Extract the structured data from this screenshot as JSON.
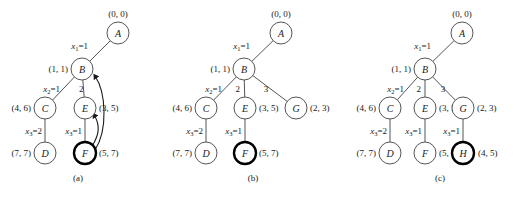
{
  "figure": {
    "width": 522,
    "height": 197,
    "background": "#ffffff",
    "node_stroke": "#555555",
    "bold_node_stroke": "#000000",
    "text_color": "#1a1a1a"
  },
  "panels": [
    {
      "id": "a",
      "caption": "(a)",
      "caption_pos": {
        "x": 78,
        "y": 178
      },
      "nodes": [
        {
          "key": "A",
          "label": "A",
          "x": 118,
          "y": 33,
          "r": 11,
          "bold": false,
          "pair": "(0, 0)",
          "pair_pos": "above",
          "pair_x": 118,
          "pair_y": 14
        },
        {
          "key": "B",
          "label": "B",
          "x": 82,
          "y": 69,
          "r": 11,
          "bold": false,
          "pair": "(1, 1)",
          "pair_pos": "left",
          "pair_x": 68,
          "pair_y": 69
        },
        {
          "key": "C",
          "label": "C",
          "x": 45,
          "y": 108,
          "r": 11,
          "bold": false,
          "pair": "(4, 6)",
          "pair_pos": "left",
          "pair_x": 31,
          "pair_y": 108
        },
        {
          "key": "E",
          "label": "E",
          "x": 85,
          "y": 108,
          "r": 11,
          "bold": false,
          "pair": "(3, 5)",
          "pair_pos": "right",
          "pair_x": 99,
          "pair_y": 108
        },
        {
          "key": "D",
          "label": "D",
          "x": 45,
          "y": 153,
          "r": 11,
          "bold": false,
          "pair": "(7, 7)",
          "pair_pos": "left",
          "pair_x": 31,
          "pair_y": 153
        },
        {
          "key": "F",
          "label": "F",
          "x": 85,
          "y": 153,
          "r": 11,
          "bold": true,
          "pair": "(5, 7)",
          "pair_pos": "right",
          "pair_x": 99,
          "pair_y": 153
        }
      ],
      "edges": [
        {
          "from": "A",
          "to": "B",
          "label": "x1=1",
          "var": "x",
          "sub": "1",
          "value": "=1",
          "label_x": 88,
          "label_y": 46,
          "label_anchor": "left"
        },
        {
          "from": "B",
          "to": "C",
          "label": "x2=1",
          "var": "x",
          "sub": "2",
          "value": "=1",
          "label_x": 60,
          "label_y": 89,
          "label_anchor": "left"
        },
        {
          "from": "B",
          "to": "E",
          "label": "2",
          "var": "",
          "sub": "",
          "value": "2",
          "label_x": 79,
          "label_y": 89,
          "label_anchor": "rt"
        },
        {
          "from": "C",
          "to": "D",
          "label": "x3=2",
          "var": "x",
          "sub": "3",
          "value": "=2",
          "label_x": 42,
          "label_y": 131,
          "label_anchor": "left"
        },
        {
          "from": "E",
          "to": "F",
          "label": "x3=1",
          "var": "x",
          "sub": "3",
          "value": "=1",
          "label_x": 82,
          "label_y": 131,
          "label_anchor": "left"
        }
      ],
      "arrows": [
        {
          "name": "arrow-f-to-e",
          "d": "M 92 146 C 100 134 100 124 94 115"
        },
        {
          "name": "arrow-f-to-b",
          "d": "M 95 150 C 108 130 106 92 95 76"
        }
      ]
    },
    {
      "id": "b",
      "caption": "(b)",
      "caption_pos": {
        "x": 253,
        "y": 178
      },
      "nodes": [
        {
          "key": "A",
          "label": "A",
          "x": 281,
          "y": 33,
          "r": 11,
          "bold": false,
          "pair": "(0, 0)",
          "pair_pos": "above",
          "pair_x": 281,
          "pair_y": 14
        },
        {
          "key": "B",
          "label": "B",
          "x": 244,
          "y": 69,
          "r": 11,
          "bold": false,
          "pair": "(1, 1)",
          "pair_pos": "left",
          "pair_x": 230,
          "pair_y": 69
        },
        {
          "key": "C",
          "label": "C",
          "x": 206,
          "y": 108,
          "r": 11,
          "bold": false,
          "pair": "(4, 6)",
          "pair_pos": "left",
          "pair_x": 192,
          "pair_y": 108
        },
        {
          "key": "E",
          "label": "E",
          "x": 245,
          "y": 108,
          "r": 11,
          "bold": false,
          "pair": "(3, 5)",
          "pair_pos": "right",
          "pair_x": 259,
          "pair_y": 108
        },
        {
          "key": "G",
          "label": "G",
          "x": 296,
          "y": 108,
          "r": 11,
          "bold": false,
          "pair": "(2, 3)",
          "pair_pos": "right",
          "pair_x": 310,
          "pair_y": 108
        },
        {
          "key": "D",
          "label": "D",
          "x": 206,
          "y": 153,
          "r": 11,
          "bold": false,
          "pair": "(7, 7)",
          "pair_pos": "left",
          "pair_x": 192,
          "pair_y": 153
        },
        {
          "key": "F",
          "label": "F",
          "x": 245,
          "y": 153,
          "r": 11,
          "bold": true,
          "pair": "(5, 7)",
          "pair_pos": "right",
          "pair_x": 259,
          "pair_y": 153
        }
      ],
      "edges": [
        {
          "from": "A",
          "to": "B",
          "label": "x1=1",
          "var": "x",
          "sub": "1",
          "value": "=1",
          "label_x": 250,
          "label_y": 46,
          "label_anchor": "left"
        },
        {
          "from": "B",
          "to": "C",
          "label": "x2=1",
          "var": "x",
          "sub": "2",
          "value": "=1",
          "label_x": 222,
          "label_y": 89,
          "label_anchor": "left"
        },
        {
          "from": "B",
          "to": "E",
          "label": "2",
          "var": "",
          "sub": "",
          "value": "2",
          "label_x": 240,
          "label_y": 89,
          "label_anchor": "left"
        },
        {
          "from": "B",
          "to": "G",
          "label": "3",
          "var": "",
          "sub": "",
          "value": "3",
          "label_x": 266,
          "label_y": 89,
          "label_anchor": "mid"
        },
        {
          "from": "C",
          "to": "D",
          "label": "x3=2",
          "var": "x",
          "sub": "3",
          "value": "=2",
          "label_x": 203,
          "label_y": 131,
          "label_anchor": "left"
        },
        {
          "from": "E",
          "to": "F",
          "label": "x3=1",
          "var": "x",
          "sub": "3",
          "value": "=1",
          "label_x": 242,
          "label_y": 131,
          "label_anchor": "left"
        }
      ],
      "arrows": []
    },
    {
      "id": "c",
      "caption": "(c)",
      "caption_pos": {
        "x": 440,
        "y": 178
      },
      "nodes": [
        {
          "key": "A",
          "label": "A",
          "x": 462,
          "y": 33,
          "r": 11,
          "bold": false,
          "pair": "(0, 0)",
          "pair_pos": "above",
          "pair_x": 462,
          "pair_y": 14
        },
        {
          "key": "B",
          "label": "B",
          "x": 425,
          "y": 69,
          "r": 11,
          "bold": false,
          "pair": "(1, 1)",
          "pair_pos": "left",
          "pair_x": 411,
          "pair_y": 69
        },
        {
          "key": "C",
          "label": "C",
          "x": 390,
          "y": 108,
          "r": 11,
          "bold": false,
          "pair": "(4, 6)",
          "pair_pos": "left",
          "pair_x": 376,
          "pair_y": 108
        },
        {
          "key": "E",
          "label": "E",
          "x": 425,
          "y": 108,
          "r": 11,
          "bold": false,
          "pair": "(3, 5)",
          "pair_pos": "right",
          "pair_x": 439,
          "pair_y": 108
        },
        {
          "key": "G",
          "label": "G",
          "x": 463,
          "y": 108,
          "r": 11,
          "bold": false,
          "pair": "(2, 3)",
          "pair_pos": "right",
          "pair_x": 477,
          "pair_y": 108
        },
        {
          "key": "D",
          "label": "D",
          "x": 390,
          "y": 153,
          "r": 11,
          "bold": false,
          "pair": "(7, 7)",
          "pair_pos": "left",
          "pair_x": 376,
          "pair_y": 153
        },
        {
          "key": "F",
          "label": "F",
          "x": 425,
          "y": 153,
          "r": 11,
          "bold": false,
          "pair": "(5, 7)",
          "pair_pos": "right",
          "pair_x": 439,
          "pair_y": 153
        },
        {
          "key": "H",
          "label": "H",
          "x": 463,
          "y": 153,
          "r": 11,
          "bold": true,
          "pair": "(4, 5)",
          "pair_pos": "right",
          "pair_x": 478,
          "pair_y": 153
        }
      ],
      "edges": [
        {
          "from": "A",
          "to": "B",
          "label": "x1=1",
          "var": "x",
          "sub": "1",
          "value": "=1",
          "label_x": 431,
          "label_y": 46,
          "label_anchor": "left"
        },
        {
          "from": "B",
          "to": "C",
          "label": "x2=1",
          "var": "x",
          "sub": "2",
          "value": "=1",
          "label_x": 404,
          "label_y": 89,
          "label_anchor": "left"
        },
        {
          "from": "B",
          "to": "E",
          "label": "2",
          "var": "",
          "sub": "",
          "value": "2",
          "label_x": 421,
          "label_y": 89,
          "label_anchor": "left"
        },
        {
          "from": "B",
          "to": "G",
          "label": "3",
          "var": "",
          "sub": "",
          "value": "3",
          "label_x": 443,
          "label_y": 89,
          "label_anchor": "mid"
        },
        {
          "from": "C",
          "to": "D",
          "label": "x3=2",
          "var": "x",
          "sub": "3",
          "value": "=2",
          "label_x": 387,
          "label_y": 131,
          "label_anchor": "left"
        },
        {
          "from": "E",
          "to": "F",
          "label": "x3=1",
          "var": "x",
          "sub": "3",
          "value": "=1",
          "label_x": 422,
          "label_y": 131,
          "label_anchor": "left"
        },
        {
          "from": "G",
          "to": "H",
          "label": "x3=1",
          "var": "x",
          "sub": "3",
          "value": "=1",
          "label_x": 460,
          "label_y": 131,
          "label_anchor": "left"
        }
      ],
      "arrows": []
    }
  ]
}
